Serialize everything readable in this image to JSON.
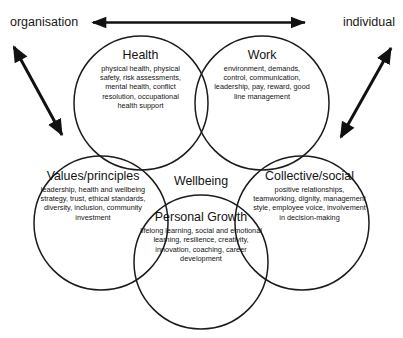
{
  "diagram": {
    "kind": "venn-diagram",
    "title_center": "Wellbeing",
    "stroke_color": "#1c1c1c",
    "text_color": "#141414",
    "background": "#ffffff",
    "axis": {
      "left_label": "organisation",
      "right_label": "individual",
      "arrow_name": "double-headed-horizontal-arrow"
    },
    "corner_arrows": {
      "left_name": "double-headed-diagonal-arrow-left",
      "right_name": "double-headed-diagonal-arrow-right"
    },
    "lobes": [
      {
        "id": "health",
        "title": "Health",
        "body": "physical health, physical safety, risk assessments, mental health, conflict resolution, occupational health support"
      },
      {
        "id": "work",
        "title": "Work",
        "body": "environment, demands, control, communication, leadership, pay, reward, good line management"
      },
      {
        "id": "values",
        "title": "Values/principles",
        "body": "leadership, health and wellbeing strategy, trust, ethical standards, diversity, inclusion, community investment"
      },
      {
        "id": "collective",
        "title": "Collective/social",
        "body": "positive relationships, teamworking, dignity, management style, employee voice, involvement in decision-making"
      },
      {
        "id": "growth",
        "title": "Personal Growth",
        "body": "lifelong learning, social and emotional learning, resilience, creativity, innovation, coaching, career development"
      }
    ]
  }
}
